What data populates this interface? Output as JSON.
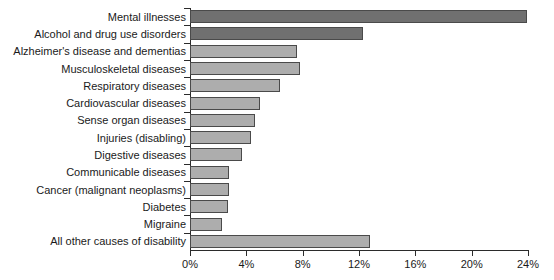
{
  "chart_data": {
    "type": "bar",
    "orientation": "horizontal",
    "title": "",
    "subtitle": "",
    "xlabel": "",
    "ylabel": "",
    "xlim": [
      0,
      24
    ],
    "grid": false,
    "legend": "none",
    "value_suffix": "%",
    "xticks": [
      {
        "value": 0,
        "label": "0%"
      },
      {
        "value": 4,
        "label": "4%"
      },
      {
        "value": 8,
        "label": "8%"
      },
      {
        "value": 12,
        "label": "12%"
      },
      {
        "value": 16,
        "label": "16%"
      },
      {
        "value": 20,
        "label": "20%"
      },
      {
        "value": 24,
        "label": "24%"
      }
    ],
    "categories": [
      "Mental illnesses",
      "Alcohol and drug use disorders",
      "Alzheimer's disease and dementias",
      "Musculoskeletal diseases",
      "Respiratory diseases",
      "Cardiovascular diseases",
      "Sense organ diseases",
      "Injuries (disabling)",
      "Digestive diseases",
      "Communicable diseases",
      "Cancer (malignant neoplasms)",
      "Diabetes",
      "Migraine",
      "All other causes of disability"
    ],
    "values": [
      23.9,
      12.3,
      7.6,
      7.8,
      6.4,
      5.0,
      4.6,
      4.3,
      3.7,
      2.8,
      2.8,
      2.7,
      2.3,
      12.8
    ],
    "colors": {
      "bar_dark": "#707070",
      "bar_light": "#adadad",
      "bar_border": "#4a4a4a",
      "axis": "#2b2b2b",
      "text": "#1a1a1a",
      "background": "#ffffff"
    },
    "bar_shades": [
      "bar_dark",
      "bar_dark",
      "bar_light",
      "bar_light",
      "bar_light",
      "bar_light",
      "bar_light",
      "bar_light",
      "bar_light",
      "bar_light",
      "bar_light",
      "bar_light",
      "bar_light",
      "bar_light"
    ]
  }
}
